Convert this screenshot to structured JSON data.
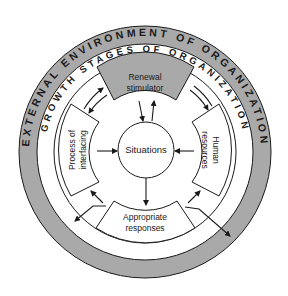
{
  "diagram": {
    "outer_ring_label": "EXTERNAL ENVIRONMENT OF ORGANIZATION",
    "inner_ring_label": "GROWTH STAGES OF ORGANIZATION",
    "center": "Situations",
    "nodes": {
      "top": [
        "Renewal",
        "stimulator"
      ],
      "left": [
        "Process of",
        "interfacing"
      ],
      "right": [
        "Human",
        "resources"
      ],
      "bottom": [
        "Appropriate",
        "responses"
      ]
    },
    "colors": {
      "outer_band": "#a9a9a9",
      "top_box": "#a9a9a9",
      "lines": "#1a1a1a",
      "background": "#ffffff"
    }
  }
}
